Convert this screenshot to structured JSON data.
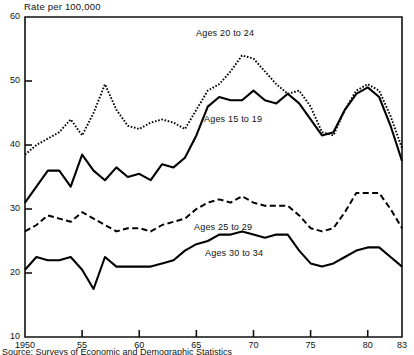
{
  "chart_data": {
    "type": "line",
    "title": "",
    "ylabel": "Rate per 100,000",
    "xlabel": "",
    "ylim": [
      10,
      60
    ],
    "xlim": [
      1950,
      1983
    ],
    "grid": false,
    "legend_position": "inline-annotations",
    "ytick_labels": [
      "10",
      "20",
      "30",
      "40",
      "50",
      "60"
    ],
    "ytick_values": [
      10,
      20,
      30,
      40,
      50,
      60
    ],
    "xtick_labels": [
      "1950",
      "55",
      "60",
      "65",
      "70",
      "75",
      "80",
      "83"
    ],
    "xtick_values": [
      1950,
      1955,
      1960,
      1965,
      1970,
      1975,
      1980,
      1983
    ],
    "x": [
      1950,
      1951,
      1952,
      1953,
      1954,
      1955,
      1956,
      1957,
      1958,
      1959,
      1960,
      1961,
      1962,
      1963,
      1964,
      1965,
      1966,
      1967,
      1968,
      1969,
      1970,
      1971,
      1972,
      1973,
      1974,
      1975,
      1976,
      1977,
      1978,
      1979,
      1980,
      1981,
      1982,
      1983
    ],
    "series": [
      {
        "name": "Ages 20 to 24",
        "style": "dotted",
        "color": "#000000",
        "values": [
          38.5,
          40.0,
          41.0,
          42.0,
          44.0,
          41.5,
          45.0,
          49.5,
          45.5,
          43.0,
          42.5,
          43.5,
          44.0,
          43.5,
          42.5,
          45.5,
          48.5,
          49.5,
          51.5,
          54.0,
          53.5,
          51.5,
          49.5,
          48.0,
          48.5,
          46.0,
          42.0,
          41.5,
          45.5,
          48.5,
          49.5,
          48.5,
          44.5,
          39.5
        ]
      },
      {
        "name": "Ages 15 to 19",
        "style": "solid",
        "color": "#000000",
        "values": [
          31.0,
          33.5,
          36.0,
          36.0,
          33.5,
          38.5,
          36.0,
          34.5,
          36.5,
          35.0,
          35.5,
          34.5,
          37.0,
          36.5,
          38.0,
          41.5,
          46.0,
          47.5,
          47.0,
          47.0,
          48.5,
          47.0,
          46.5,
          48.0,
          46.5,
          44.0,
          41.5,
          42.0,
          45.5,
          48.0,
          49.0,
          47.5,
          43.0,
          37.5
        ]
      },
      {
        "name": "Ages 25 to 29",
        "style": "dashed",
        "color": "#000000",
        "values": [
          26.5,
          27.5,
          29.0,
          28.5,
          28.0,
          29.5,
          28.5,
          27.5,
          26.5,
          27.0,
          27.0,
          26.5,
          27.5,
          28.0,
          28.5,
          30.0,
          31.0,
          31.5,
          31.0,
          32.0,
          31.0,
          30.5,
          30.5,
          30.5,
          29.0,
          27.0,
          26.5,
          27.0,
          29.5,
          32.5,
          32.5,
          32.5,
          30.0,
          27.0
        ]
      },
      {
        "name": "Ages 30 to 34",
        "style": "solid",
        "color": "#000000",
        "values": [
          20.5,
          22.5,
          22.0,
          22.0,
          22.5,
          20.5,
          17.5,
          22.5,
          21.0,
          21.0,
          21.0,
          21.0,
          21.5,
          22.0,
          23.5,
          24.5,
          25.0,
          26.0,
          26.0,
          26.5,
          26.0,
          25.5,
          26.0,
          26.0,
          23.5,
          21.5,
          21.0,
          21.5,
          22.5,
          23.5,
          24.0,
          24.0,
          22.5,
          21.0
        ]
      }
    ],
    "annotations": [
      {
        "text": "Ages 20 to 24",
        "x_px": 196,
        "y_px": 28
      },
      {
        "text": "Ages 15 to 19",
        "x_px": 204,
        "y_px": 114
      },
      {
        "text": "Ages 25 to 29",
        "x_px": 194,
        "y_px": 222
      },
      {
        "text": "Ages 30 to 34",
        "x_px": 205,
        "y_px": 248
      }
    ]
  },
  "axis": {
    "y_title": "Rate per 100,000"
  },
  "footnote": {
    "text": "Source: Surveys of Economic and Demographic Statistics"
  }
}
